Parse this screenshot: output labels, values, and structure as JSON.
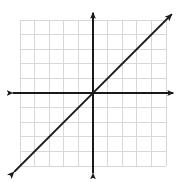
{
  "figure": {
    "name": "coordinate-plane-line-graph",
    "width": 183,
    "height": 182,
    "background_color": "#ffffff",
    "caption": ""
  },
  "chart_data": {
    "type": "line",
    "title": "",
    "subtitle": "",
    "xlabel": "",
    "ylabel": "",
    "xlim": [
      -5.5,
      5.5
    ],
    "ylim": [
      -5.5,
      5.5
    ],
    "grid": true,
    "grid_spacing": 1,
    "grid_color": "#d8d8d8",
    "axis_color": "#1a1a1a",
    "legend": null,
    "legend_position": "none",
    "xticks": [
      -5,
      -4,
      -3,
      -2,
      -1,
      0,
      1,
      2,
      3,
      4,
      5
    ],
    "yticks": [
      -5,
      -4,
      -3,
      -2,
      -1,
      0,
      1,
      2,
      3,
      4,
      5
    ],
    "xtick_labels": [
      "",
      "",
      "",
      "",
      "",
      "",
      "",
      "",
      "",
      "",
      ""
    ],
    "ytick_labels": [
      "",
      "",
      "",
      "",
      "",
      "",
      "",
      "",
      "",
      "",
      ""
    ],
    "axes": {
      "x_axis": {
        "name": "x-axis",
        "from": [
          -5.5,
          0
        ],
        "to": [
          5.5,
          0
        ],
        "arrow_start": true,
        "arrow_end": true
      },
      "y_axis": {
        "name": "y-axis",
        "from": [
          0,
          -5.5
        ],
        "to": [
          0,
          5.5
        ],
        "arrow_start": true,
        "arrow_end": true
      }
    },
    "series": [
      {
        "name": "y = x",
        "equation": "y = x",
        "slope": 1,
        "intercept": 0,
        "color": "#1a1a1a",
        "width": 2,
        "arrow_start": true,
        "arrow_end": true,
        "x": [
          -5.4,
          5.4
        ],
        "values": [
          -5.4,
          5.4
        ],
        "points": [
          [
            -5,
            -5
          ],
          [
            -4,
            -4
          ],
          [
            -3,
            -3
          ],
          [
            -2,
            -2
          ],
          [
            -1,
            -1
          ],
          [
            0,
            0
          ],
          [
            1,
            1
          ],
          [
            2,
            2
          ],
          [
            3,
            3
          ],
          [
            4,
            4
          ],
          [
            5,
            5
          ]
        ]
      }
    ],
    "annotations": []
  },
  "geometry": {
    "origin_px": [
      93,
      93
    ],
    "cell_px": 14.6,
    "grid_left_px": 20,
    "grid_right_px": 166,
    "grid_top_px": 20,
    "grid_bottom_px": 166
  }
}
